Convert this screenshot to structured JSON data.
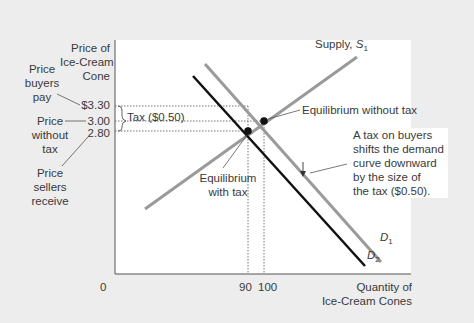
{
  "diagram": {
    "y_axis_label": [
      "Price of",
      "Ice-Cream",
      "Cone"
    ],
    "x_axis_label": [
      "Quantity of",
      "Ice-Cream Cones"
    ],
    "origin_label": "0",
    "y_ticks": {
      "p330": "$3.30",
      "p300": "3.00",
      "p280": "2.80"
    },
    "x_ticks": {
      "q90": "90",
      "q100": "100"
    },
    "side_labels": {
      "buyers": [
        "Price",
        "buyers",
        "pay"
      ],
      "without": [
        "Price",
        "without",
        "tax"
      ],
      "sellers": [
        "Price",
        "sellers",
        "receive"
      ]
    },
    "tax_label": "Tax ($0.50)",
    "supply_label": "Supply, ",
    "supply_sub": "S",
    "supply_subscript": "1",
    "d1_label": "D",
    "d1_subscript": "1",
    "d2_label": "D",
    "d2_subscript": "2",
    "eq_without_tax": "Equilibrium without tax",
    "eq_with_tax": [
      "Equilibrium",
      "with tax"
    ],
    "note": [
      "A tax on buyers",
      "shifts the demand",
      "curve downward",
      "by the size of",
      "the tax ($0.50)."
    ],
    "colors": {
      "demand_original": "#9a9a9a",
      "demand_shifted": "#111111",
      "supply": "#9a9a9a",
      "panel": "#ffffff",
      "background": "#ededed"
    }
  }
}
